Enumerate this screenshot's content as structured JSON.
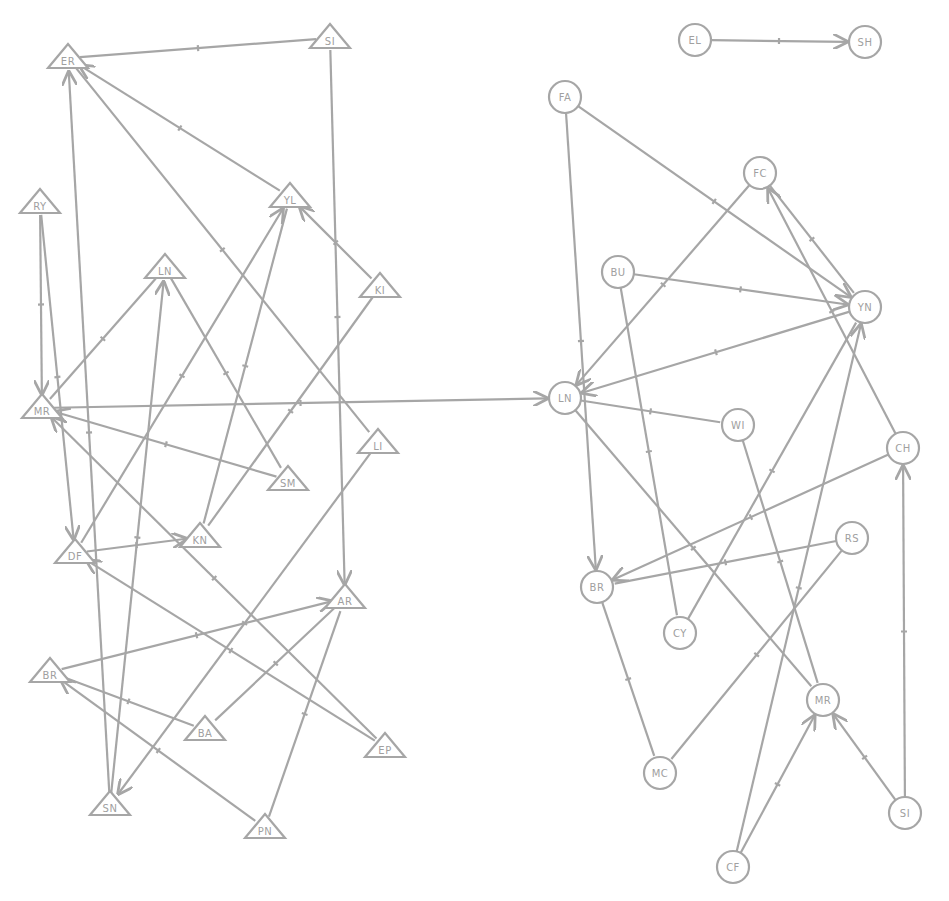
{
  "diagram": {
    "type": "sociogram",
    "colors": {
      "stroke": "#a6a6a6",
      "label": "#a0a0a0",
      "background": "#ffffff"
    },
    "left_group": {
      "shape": "triangle",
      "nodes": [
        {
          "id": "t_ER",
          "label": "ER",
          "x": 68,
          "y": 58
        },
        {
          "id": "t_SI",
          "label": "SI",
          "x": 330,
          "y": 38
        },
        {
          "id": "t_RY",
          "label": "RY",
          "x": 40,
          "y": 203
        },
        {
          "id": "t_YL",
          "label": "YL",
          "x": 290,
          "y": 197
        },
        {
          "id": "t_LN",
          "label": "LN",
          "x": 165,
          "y": 268
        },
        {
          "id": "t_KI",
          "label": "KI",
          "x": 380,
          "y": 287
        },
        {
          "id": "t_MR",
          "label": "MR",
          "x": 42,
          "y": 408
        },
        {
          "id": "t_SM",
          "label": "SM",
          "x": 288,
          "y": 480
        },
        {
          "id": "t_LI",
          "label": "LI",
          "x": 378,
          "y": 443
        },
        {
          "id": "t_DF",
          "label": "DF",
          "x": 75,
          "y": 553
        },
        {
          "id": "t_KN",
          "label": "KN",
          "x": 200,
          "y": 537
        },
        {
          "id": "t_AR",
          "label": "AR",
          "x": 345,
          "y": 598
        },
        {
          "id": "t_BR",
          "label": "BR",
          "x": 50,
          "y": 672
        },
        {
          "id": "t_BA",
          "label": "BA",
          "x": 205,
          "y": 730
        },
        {
          "id": "t_EP",
          "label": "EP",
          "x": 385,
          "y": 747
        },
        {
          "id": "t_SN",
          "label": "SN",
          "x": 110,
          "y": 805
        },
        {
          "id": "t_PN",
          "label": "PN",
          "x": 265,
          "y": 828
        }
      ]
    },
    "right_group": {
      "shape": "circle",
      "nodes": [
        {
          "id": "c_EL",
          "label": "EL",
          "x": 695,
          "y": 40
        },
        {
          "id": "c_SH",
          "label": "SH",
          "x": 865,
          "y": 42
        },
        {
          "id": "c_FA",
          "label": "FA",
          "x": 565,
          "y": 97
        },
        {
          "id": "c_FC",
          "label": "FC",
          "x": 760,
          "y": 173
        },
        {
          "id": "c_BU",
          "label": "BU",
          "x": 618,
          "y": 272
        },
        {
          "id": "c_YN",
          "label": "YN",
          "x": 865,
          "y": 307
        },
        {
          "id": "c_LN",
          "label": "LN",
          "x": 565,
          "y": 398
        },
        {
          "id": "c_WI",
          "label": "WI",
          "x": 738,
          "y": 425
        },
        {
          "id": "c_CH",
          "label": "CH",
          "x": 903,
          "y": 448
        },
        {
          "id": "c_RS",
          "label": "RS",
          "x": 852,
          "y": 538
        },
        {
          "id": "c_BR",
          "label": "BR",
          "x": 597,
          "y": 587
        },
        {
          "id": "c_CY",
          "label": "CY",
          "x": 680,
          "y": 633
        },
        {
          "id": "c_MR",
          "label": "MR",
          "x": 823,
          "y": 700
        },
        {
          "id": "c_MC",
          "label": "MC",
          "x": 660,
          "y": 773
        },
        {
          "id": "c_SI",
          "label": "SI",
          "x": 905,
          "y": 813
        },
        {
          "id": "c_CF",
          "label": "CF",
          "x": 733,
          "y": 867
        }
      ]
    },
    "edges": [
      {
        "from": "t_ER",
        "to": "t_SI",
        "arrow": false
      },
      {
        "from": "t_SI",
        "to": "t_AR",
        "arrow": true
      },
      {
        "from": "t_YL",
        "to": "t_ER",
        "arrow": true
      },
      {
        "from": "t_ER",
        "to": "t_LI",
        "arrow": false
      },
      {
        "from": "t_SN",
        "to": "t_ER",
        "arrow": true
      },
      {
        "from": "t_RY",
        "to": "t_MR",
        "arrow": true
      },
      {
        "from": "t_RY",
        "to": "t_DF",
        "arrow": true
      },
      {
        "from": "t_KI",
        "to": "t_YL",
        "arrow": true
      },
      {
        "from": "t_DF",
        "to": "t_YL",
        "arrow": true
      },
      {
        "from": "t_YL",
        "to": "t_KN",
        "arrow": false
      },
      {
        "from": "t_MR",
        "to": "t_LN",
        "arrow": false
      },
      {
        "from": "t_SN",
        "to": "t_LN",
        "arrow": true
      },
      {
        "from": "t_LN",
        "to": "t_SM",
        "arrow": false
      },
      {
        "from": "t_KI",
        "to": "t_KN",
        "arrow": false
      },
      {
        "from": "t_SM",
        "to": "t_MR",
        "arrow": true
      },
      {
        "from": "t_EP",
        "to": "t_MR",
        "arrow": true
      },
      {
        "from": "t_MR",
        "to": "c_LN",
        "arrow": true
      },
      {
        "from": "t_LI",
        "to": "t_SN",
        "arrow": true
      },
      {
        "from": "t_DF",
        "to": "t_KN",
        "arrow": true
      },
      {
        "from": "t_EP",
        "to": "t_DF",
        "arrow": true
      },
      {
        "from": "t_BR",
        "to": "t_AR",
        "arrow": true
      },
      {
        "from": "t_BA",
        "to": "t_BR",
        "arrow": false
      },
      {
        "from": "t_AR",
        "to": "t_BA",
        "arrow": false
      },
      {
        "from": "t_PN",
        "to": "t_AR",
        "arrow": false
      },
      {
        "from": "t_PN",
        "to": "t_BR",
        "arrow": true
      },
      {
        "from": "c_EL",
        "to": "c_SH",
        "arrow": true
      },
      {
        "from": "c_FA",
        "to": "c_BR",
        "arrow": true
      },
      {
        "from": "c_FA",
        "to": "c_YN",
        "arrow": true
      },
      {
        "from": "c_FC",
        "to": "c_LN",
        "arrow": true
      },
      {
        "from": "c_FC",
        "to": "c_YN",
        "arrow": false
      },
      {
        "from": "c_CH",
        "to": "c_FC",
        "arrow": true
      },
      {
        "from": "c_BU",
        "to": "c_YN",
        "arrow": true
      },
      {
        "from": "c_BU",
        "to": "c_CY",
        "arrow": false
      },
      {
        "from": "c_YN",
        "to": "c_LN",
        "arrow": true
      },
      {
        "from": "c_LN",
        "to": "c_WI",
        "arrow": false
      },
      {
        "from": "c_LN",
        "to": "c_MR",
        "arrow": false
      },
      {
        "from": "c_WI",
        "to": "c_MR",
        "arrow": false
      },
      {
        "from": "c_CY",
        "to": "c_YN",
        "arrow": false
      },
      {
        "from": "c_CF",
        "to": "c_YN",
        "arrow": true
      },
      {
        "from": "c_CH",
        "to": "c_BR",
        "arrow": true
      },
      {
        "from": "c_RS",
        "to": "c_BR",
        "arrow": false
      },
      {
        "from": "c_RS",
        "to": "c_MC",
        "arrow": false
      },
      {
        "from": "c_BR",
        "to": "c_MC",
        "arrow": false
      },
      {
        "from": "c_SI",
        "to": "c_CH",
        "arrow": true
      },
      {
        "from": "c_SI",
        "to": "c_MR",
        "arrow": true
      },
      {
        "from": "c_CF",
        "to": "c_MR",
        "arrow": true
      }
    ]
  }
}
